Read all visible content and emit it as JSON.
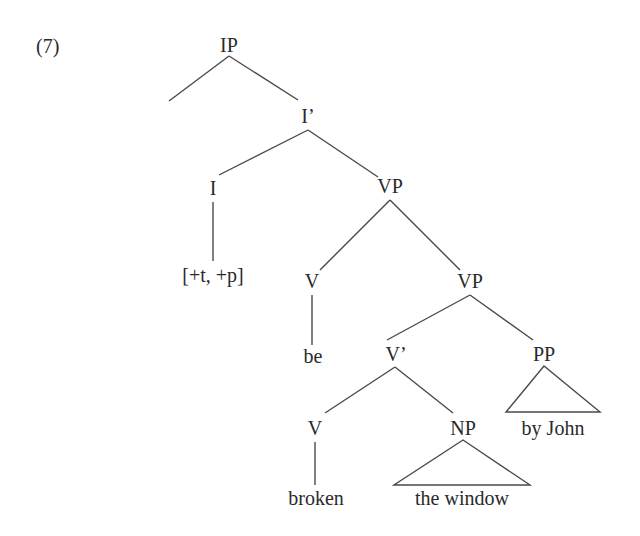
{
  "example_number": "(7)",
  "tree": {
    "nodes": {
      "ip": "IP",
      "i_bar": "I’",
      "i": "I",
      "i_features": "[+t,  +p]",
      "vp_upper": "VP",
      "v_be": "V",
      "be": "be",
      "vp_lower": "VP",
      "v_bar": "V’",
      "pp": "PP",
      "by_john": "by  John",
      "v_broken": "V",
      "broken": "broken",
      "np": "NP",
      "the_window": "the  window"
    },
    "structure": "[IP [ ] [I' [I [+t, +p]] [VP [V be] [VP [V' [V broken] [NP the window]] [PP by John]]]]]"
  },
  "colors": {
    "line": "#4a4a4a",
    "text": "#2a2a2a",
    "background": "#ffffff"
  }
}
